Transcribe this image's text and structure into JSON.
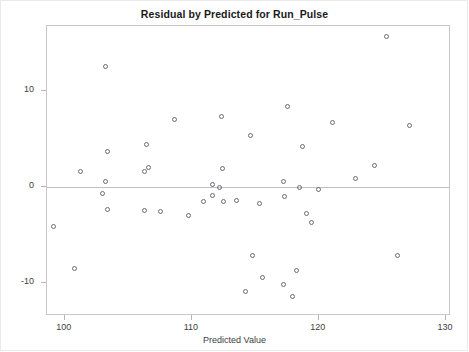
{
  "chart_data": {
    "type": "scatter",
    "title": "Residual by Predicted for Run_Pulse",
    "xlabel": "Predicted Value",
    "ylabel": "Residual",
    "xlim": [
      98.6,
      130.4
    ],
    "ylim": [
      -13.4,
      16.8
    ],
    "xticks": [
      100,
      110,
      120,
      130
    ],
    "yticks": [
      10,
      0,
      -10
    ],
    "grid": false,
    "legend": null,
    "reference_line": {
      "axis": "y",
      "value": 0,
      "color": "#c0c0c0"
    },
    "marker": {
      "shape": "open-circle",
      "color": "#6b6b78",
      "size": 5
    },
    "points": [
      {
        "x": 103.2,
        "y": 12.6
      },
      {
        "x": 125.3,
        "y": 15.7
      },
      {
        "x": 108.6,
        "y": 7.1
      },
      {
        "x": 112.3,
        "y": 7.4
      },
      {
        "x": 117.5,
        "y": 8.4
      },
      {
        "x": 114.6,
        "y": 5.4
      },
      {
        "x": 127.1,
        "y": 6.4
      },
      {
        "x": 121.1,
        "y": 6.7
      },
      {
        "x": 118.7,
        "y": 4.2
      },
      {
        "x": 106.4,
        "y": 4.5
      },
      {
        "x": 103.4,
        "y": 3.7
      },
      {
        "x": 112.4,
        "y": 2.0
      },
      {
        "x": 124.4,
        "y": 2.3
      },
      {
        "x": 106.6,
        "y": 2.1
      },
      {
        "x": 106.3,
        "y": 1.6
      },
      {
        "x": 101.2,
        "y": 1.7
      },
      {
        "x": 103.2,
        "y": 0.6
      },
      {
        "x": 112.2,
        "y": 0.0
      },
      {
        "x": 111.6,
        "y": 0.3
      },
      {
        "x": 117.2,
        "y": 0.6
      },
      {
        "x": 118.5,
        "y": 0.0
      },
      {
        "x": 122.9,
        "y": 0.9
      },
      {
        "x": 111.6,
        "y": -0.9
      },
      {
        "x": 103.0,
        "y": -0.6
      },
      {
        "x": 117.3,
        "y": -1.0
      },
      {
        "x": 120.0,
        "y": -0.2
      },
      {
        "x": 103.4,
        "y": -2.3
      },
      {
        "x": 110.9,
        "y": -1.5
      },
      {
        "x": 112.5,
        "y": -1.5
      },
      {
        "x": 113.5,
        "y": -1.4
      },
      {
        "x": 115.3,
        "y": -1.7
      },
      {
        "x": 107.5,
        "y": -2.5
      },
      {
        "x": 106.3,
        "y": -2.4
      },
      {
        "x": 109.7,
        "y": -2.9
      },
      {
        "x": 119.0,
        "y": -2.7
      },
      {
        "x": 119.4,
        "y": -3.7
      },
      {
        "x": 99.1,
        "y": -4.1
      },
      {
        "x": 114.8,
        "y": -7.1
      },
      {
        "x": 126.2,
        "y": -7.1
      },
      {
        "x": 100.8,
        "y": -8.5
      },
      {
        "x": 115.6,
        "y": -9.4
      },
      {
        "x": 118.2,
        "y": -8.7
      },
      {
        "x": 114.2,
        "y": -10.9
      },
      {
        "x": 117.2,
        "y": -10.1
      },
      {
        "x": 117.9,
        "y": -11.4
      }
    ]
  }
}
